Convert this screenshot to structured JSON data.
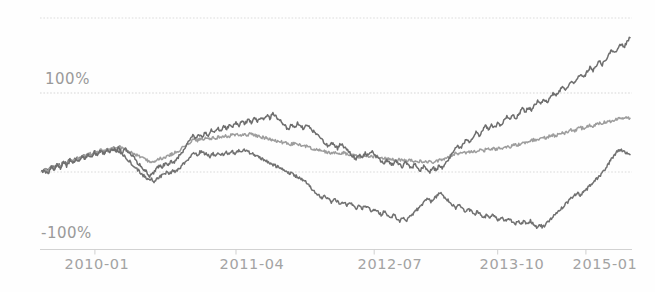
{
  "chart_data": {
    "type": "line",
    "title": "",
    "subtitle": "",
    "xlabel": "",
    "ylabel": "",
    "grid": true,
    "legend_position": "none",
    "ylim": [
      -100,
      200
    ],
    "ytick_labels": [
      "100%",
      "-100%"
    ],
    "yticks": [
      100,
      -100
    ],
    "gridlines": [
      200,
      100,
      0,
      -100
    ],
    "x_tick_labels": [
      "2010-01",
      "2011-04",
      "2012-07",
      "2013-10",
      "2015-01"
    ],
    "x_tick_positions": [
      0.09,
      0.33,
      0.565,
      0.775,
      0.925
    ],
    "colors": {
      "series_top": "#6e6e6e",
      "series_middle": "#9d9d9d",
      "series_bottom": "#717171",
      "grid": "#d8d8d8",
      "axis": "#cfcfcf",
      "tick_text": "#a3a3a3"
    },
    "series": [
      {
        "name": "series-top",
        "color": "#6e6e6e",
        "final_value": 170,
        "values": [
          0,
          2,
          -4,
          6,
          3,
          10,
          5,
          12,
          8,
          14,
          10,
          17,
          13,
          20,
          16,
          22,
          18,
          25,
          20,
          27,
          23,
          28,
          25,
          30,
          27,
          31,
          24,
          29,
          26,
          22,
          18,
          12,
          8,
          4,
          0,
          -5,
          -2,
          3,
          8,
          6,
          11,
          9,
          14,
          12,
          18,
          22,
          28,
          34,
          40,
          46,
          42,
          48,
          44,
          50,
          47,
          53,
          50,
          56,
          52,
          58,
          55,
          60,
          57,
          62,
          59,
          64,
          61,
          66,
          62,
          68,
          64,
          70,
          66,
          72,
          68,
          74,
          70,
          67,
          63,
          58,
          54,
          60,
          56,
          62,
          58,
          55,
          60,
          56,
          52,
          48,
          44,
          40,
          36,
          32,
          38,
          34,
          30,
          36,
          32,
          28,
          24,
          20,
          16,
          22,
          18,
          24,
          20,
          26,
          22,
          18,
          14,
          10,
          16,
          12,
          8,
          14,
          10,
          6,
          12,
          8,
          4,
          10,
          6,
          2,
          8,
          4,
          0,
          6,
          2,
          8,
          4,
          10,
          16,
          22,
          28,
          34,
          30,
          36,
          42,
          38,
          44,
          50,
          46,
          52,
          58,
          54,
          60,
          56,
          62,
          58,
          64,
          70,
          66,
          72,
          68,
          74,
          80,
          76,
          82,
          78,
          84,
          90,
          86,
          92,
          88,
          94,
          100,
          96,
          102,
          108,
          104,
          110,
          116,
          112,
          118,
          124,
          120,
          126,
          132,
          128,
          134,
          140,
          136,
          142,
          148,
          154,
          150,
          156,
          162,
          158,
          164,
          170
        ]
      },
      {
        "name": "series-middle",
        "color": "#9d9d9d",
        "final_value": 68,
        "values": [
          0,
          3,
          1,
          6,
          4,
          9,
          7,
          12,
          10,
          15,
          13,
          18,
          16,
          21,
          19,
          24,
          22,
          26,
          24,
          28,
          26,
          30,
          28,
          31,
          29,
          32,
          30,
          28,
          26,
          24,
          22,
          20,
          18,
          16,
          14,
          12,
          14,
          16,
          18,
          17,
          19,
          21,
          23,
          25,
          27,
          30,
          33,
          36,
          39,
          41,
          40,
          42,
          41,
          43,
          42,
          44,
          43,
          45,
          44,
          46,
          45,
          47,
          46,
          48,
          47,
          48,
          47,
          48,
          47,
          46,
          45,
          44,
          43,
          42,
          41,
          40,
          39,
          38,
          37,
          36,
          35,
          36,
          35,
          34,
          33,
          32,
          31,
          30,
          29,
          28,
          27,
          26,
          25,
          24,
          25,
          24,
          23,
          24,
          23,
          22,
          21,
          20,
          19,
          20,
          19,
          20,
          19,
          20,
          19,
          18,
          17,
          16,
          17,
          16,
          15,
          16,
          15,
          14,
          15,
          14,
          13,
          14,
          13,
          12,
          13,
          12,
          13,
          14,
          15,
          16,
          18,
          20,
          22,
          24,
          23,
          25,
          24,
          26,
          25,
          27,
          26,
          28,
          27,
          29,
          28,
          30,
          29,
          31,
          30,
          32,
          31,
          33,
          35,
          34,
          36,
          38,
          37,
          39,
          41,
          40,
          42,
          44,
          43,
          45,
          47,
          46,
          48,
          50,
          49,
          51,
          53,
          52,
          54,
          56,
          55,
          57,
          59,
          58,
          60,
          62,
          61,
          63,
          65,
          64,
          66,
          68,
          68,
          68,
          68,
          68
        ]
      },
      {
        "name": "series-bottom",
        "color": "#717171",
        "final_value": 28,
        "values": [
          0,
          4,
          2,
          7,
          5,
          10,
          8,
          13,
          11,
          16,
          14,
          18,
          16,
          21,
          19,
          23,
          21,
          25,
          23,
          27,
          25,
          28,
          26,
          29,
          27,
          25,
          22,
          18,
          14,
          10,
          6,
          2,
          -2,
          -6,
          -10,
          -8,
          -12,
          -9,
          -6,
          -3,
          0,
          -2,
          2,
          0,
          4,
          8,
          12,
          16,
          20,
          24,
          22,
          26,
          24,
          22,
          20,
          23,
          21,
          24,
          22,
          25,
          23,
          26,
          24,
          27,
          25,
          28,
          26,
          24,
          22,
          20,
          18,
          16,
          14,
          12,
          10,
          8,
          6,
          4,
          2,
          0,
          -2,
          -4,
          -6,
          -8,
          -10,
          -14,
          -18,
          -22,
          -26,
          -30,
          -34,
          -30,
          -34,
          -38,
          -34,
          -38,
          -42,
          -38,
          -42,
          -38,
          -42,
          -46,
          -42,
          -46,
          -42,
          -46,
          -50,
          -46,
          -50,
          -54,
          -50,
          -54,
          -58,
          -54,
          -58,
          -62,
          -58,
          -62,
          -58,
          -54,
          -50,
          -46,
          -42,
          -38,
          -34,
          -38,
          -34,
          -30,
          -26,
          -30,
          -34,
          -38,
          -42,
          -46,
          -42,
          -46,
          -50,
          -46,
          -50,
          -54,
          -50,
          -54,
          -58,
          -54,
          -58,
          -54,
          -58,
          -62,
          -58,
          -62,
          -58,
          -62,
          -66,
          -62,
          -66,
          -62,
          -66,
          -62,
          -66,
          -70,
          -66,
          -70,
          -66,
          -62,
          -58,
          -54,
          -50,
          -46,
          -42,
          -38,
          -34,
          -30,
          -26,
          -30,
          -26,
          -22,
          -18,
          -14,
          -10,
          -6,
          -2,
          4,
          10,
          16,
          22,
          26,
          28,
          26,
          24,
          22
        ]
      }
    ]
  },
  "axis": {
    "y_label_high": "100%",
    "y_label_low": "-100%",
    "x_labels": {
      "t0": "2010-01",
      "t1": "2011-04",
      "t2": "2012-07",
      "t3": "2013-10",
      "t4": "2015-01"
    }
  }
}
